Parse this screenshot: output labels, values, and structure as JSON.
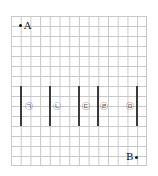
{
  "diagram": {
    "grid": {
      "columns": 14,
      "rows": 15,
      "line_color": "#c9c9c9"
    },
    "points": [
      {
        "label": "A",
        "col": 1,
        "row": 1
      },
      {
        "label": "B",
        "col": 13,
        "row": 14.1
      }
    ],
    "walls": [
      {
        "col": 1,
        "row_start": 7,
        "row_end": 11
      },
      {
        "col": 4,
        "row_start": 7,
        "row_end": 11
      },
      {
        "col": 7,
        "row_start": 7,
        "row_end": 11
      },
      {
        "col": 9,
        "row_start": 7,
        "row_end": 11
      },
      {
        "col": 13,
        "row_start": 7,
        "row_end": 11
      }
    ],
    "markers": [
      {
        "symbol": "㉠",
        "col": 2.5,
        "row": 9
      },
      {
        "symbol": "㉡",
        "col": 5.5,
        "row": 9
      },
      {
        "symbol": "㉢",
        "col": 8,
        "row": 9
      },
      {
        "symbol": "㉣",
        "col": 10,
        "row": 9
      },
      {
        "symbol": "㉤",
        "col": 12,
        "row": 9
      }
    ],
    "wall_color": "#3a3a3a"
  }
}
